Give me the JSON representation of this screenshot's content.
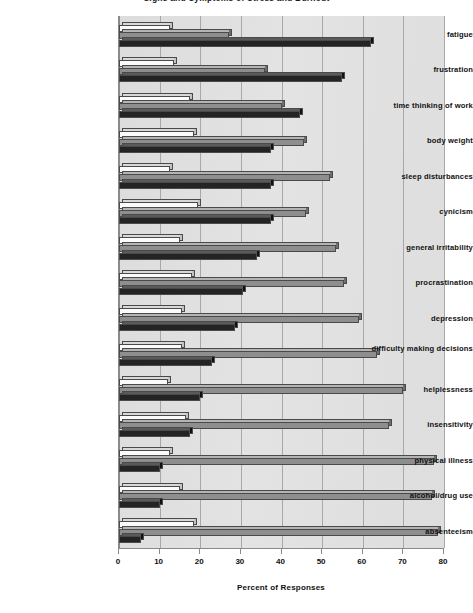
{
  "chart_data": {
    "type": "bar",
    "orientation": "horizontal",
    "title": "Signs and Symptoms of Stress and Burnout",
    "xlabel": "Percent of Responses",
    "ylabel": "",
    "xlim": [
      0,
      80
    ],
    "xticks": [
      0,
      10,
      20,
      30,
      40,
      50,
      60,
      70,
      80
    ],
    "grid": true,
    "legend": "none",
    "categories": [
      "fatigue",
      "frustration",
      "time thinking of work",
      "body weight",
      "sleep disturbances",
      "cynicism",
      "general irritability",
      "procrastination",
      "depression",
      "difficulty making decisions",
      "helplessness",
      "insensitivity",
      "physical illness",
      "alcohol/drug use",
      "absenteeism"
    ],
    "series": [
      {
        "name": "series-white",
        "color": "#fbfbfb",
        "values": [
          12.5,
          13.5,
          17.5,
          18.5,
          12.5,
          19.5,
          15.0,
          18.0,
          15.5,
          15.5,
          12.0,
          16.5,
          12.5,
          15.0,
          18.5
        ]
      },
      {
        "name": "series-gray",
        "color": "#8e8e8e",
        "values": [
          27.0,
          36.0,
          40.0,
          45.5,
          52.0,
          46.0,
          53.5,
          55.5,
          59.0,
          63.5,
          70.0,
          66.5,
          77.5,
          77.0,
          78.5
        ]
      },
      {
        "name": "series-black",
        "color": "#242424",
        "values": [
          62.0,
          55.0,
          44.5,
          37.5,
          37.5,
          37.5,
          34.0,
          30.5,
          28.5,
          23.0,
          20.0,
          17.5,
          10.0,
          10.0,
          5.5
        ]
      }
    ]
  },
  "axis": {
    "tick_labels": [
      "0",
      "10",
      "20",
      "30",
      "40",
      "50",
      "60",
      "70",
      "80"
    ],
    "x_title": "Percent of Responses"
  }
}
